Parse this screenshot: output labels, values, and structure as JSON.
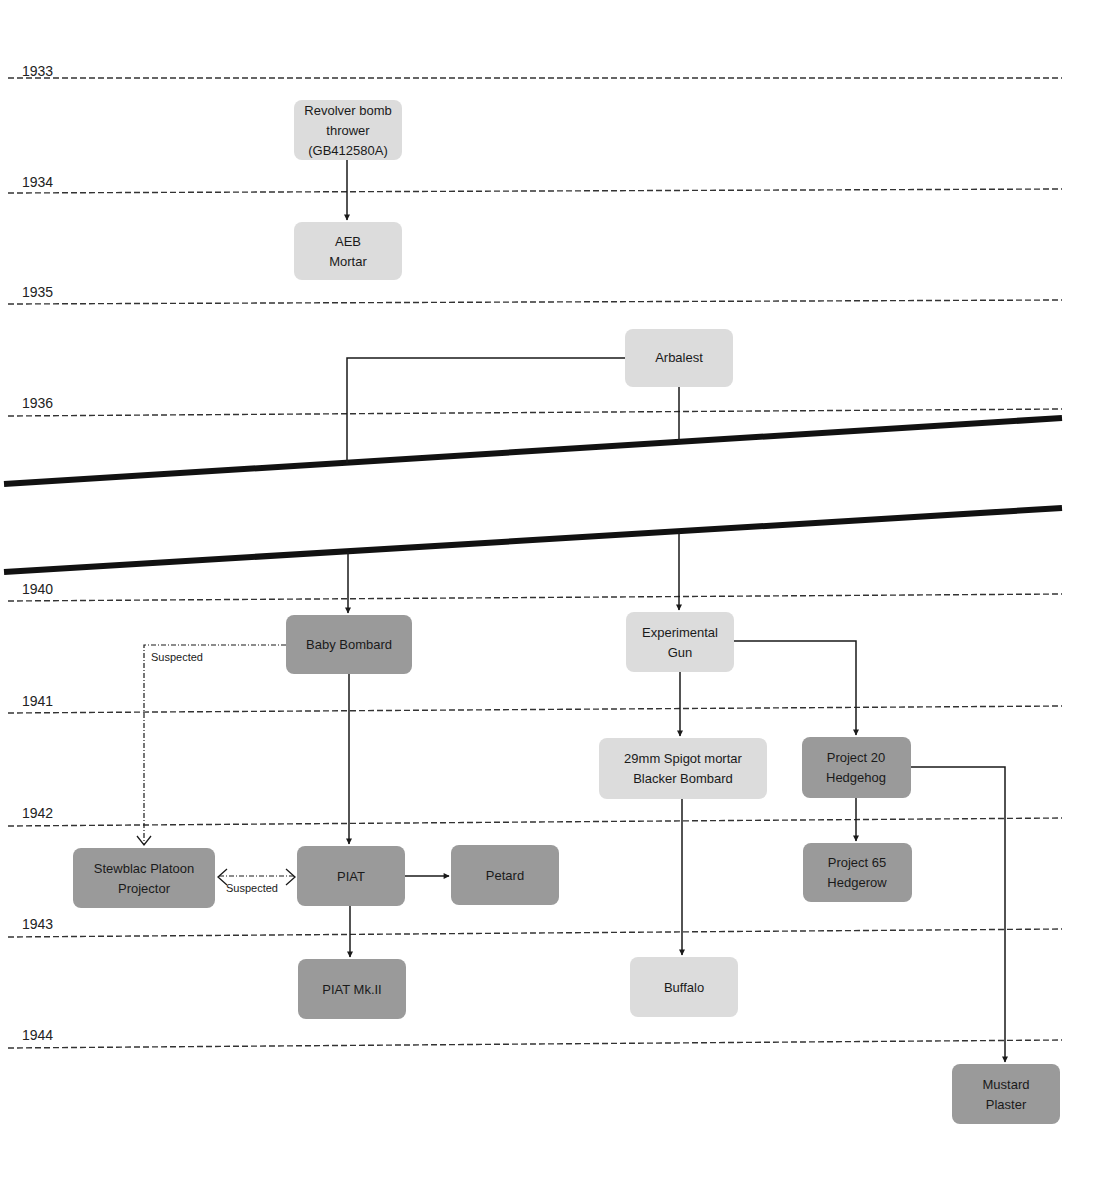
{
  "diagram": {
    "type": "timeline-genealogy",
    "colors": {
      "light_node": "#dcdcdc",
      "dark_node": "#9a9a9a",
      "line": "#1a1a1a",
      "background": "#ffffff"
    },
    "years": [
      {
        "label": "1933",
        "y": 78
      },
      {
        "label": "1934",
        "y": 190
      },
      {
        "label": "1935",
        "y": 300
      },
      {
        "label": "1936",
        "y": 412
      },
      {
        "label": "1940",
        "y": 598
      },
      {
        "label": "1941",
        "y": 710
      },
      {
        "label": "1942",
        "y": 822
      },
      {
        "label": "1943",
        "y": 932
      },
      {
        "label": "1944",
        "y": 1043
      }
    ],
    "nodes": [
      {
        "id": "revolver",
        "lines": [
          "Revolver bomb",
          "thrower",
          "(GB412580A)"
        ],
        "shade": "light",
        "x": 294,
        "y": 100,
        "w": 108,
        "h": 60
      },
      {
        "id": "aeb",
        "lines": [
          "AEB",
          "Mortar"
        ],
        "shade": "light",
        "x": 294,
        "y": 222,
        "w": 108,
        "h": 58
      },
      {
        "id": "arbalest",
        "lines": [
          "Arbalest"
        ],
        "shade": "light",
        "x": 625,
        "y": 329,
        "w": 108,
        "h": 58
      },
      {
        "id": "baby-bombard",
        "lines": [
          "Baby Bombard"
        ],
        "shade": "dark",
        "x": 286,
        "y": 615,
        "w": 126,
        "h": 59
      },
      {
        "id": "experimental-gun",
        "lines": [
          "Experimental",
          "Gun"
        ],
        "shade": "light",
        "x": 626,
        "y": 612,
        "w": 108,
        "h": 60
      },
      {
        "id": "spigot-mortar",
        "lines": [
          "29mm Spigot mortar",
          "Blacker Bombard"
        ],
        "shade": "light",
        "x": 599,
        "y": 738,
        "w": 168,
        "h": 61
      },
      {
        "id": "project-20",
        "lines": [
          "Project 20",
          "Hedgehog"
        ],
        "shade": "dark",
        "x": 802,
        "y": 737,
        "w": 109,
        "h": 61
      },
      {
        "id": "stewblac",
        "lines": [
          "Stewblac Platoon",
          "Projector"
        ],
        "shade": "dark",
        "x": 73,
        "y": 848,
        "w": 142,
        "h": 60
      },
      {
        "id": "piat",
        "lines": [
          "PIAT"
        ],
        "shade": "dark",
        "x": 297,
        "y": 846,
        "w": 108,
        "h": 60
      },
      {
        "id": "petard",
        "lines": [
          "Petard"
        ],
        "shade": "dark",
        "x": 451,
        "y": 845,
        "w": 108,
        "h": 60
      },
      {
        "id": "project-65",
        "lines": [
          "Project 65",
          "Hedgerow"
        ],
        "shade": "dark",
        "x": 803,
        "y": 843,
        "w": 109,
        "h": 59
      },
      {
        "id": "buffalo",
        "lines": [
          "Buffalo"
        ],
        "shade": "light",
        "x": 630,
        "y": 957,
        "w": 108,
        "h": 60
      },
      {
        "id": "piat-mk2",
        "lines": [
          "PIAT Mk.II"
        ],
        "shade": "dark",
        "x": 298,
        "y": 959,
        "w": 108,
        "h": 60
      },
      {
        "id": "mustard-plaster",
        "lines": [
          "Mustard",
          "Plaster"
        ],
        "shade": "dark",
        "x": 952,
        "y": 1064,
        "w": 108,
        "h": 60
      }
    ],
    "edges": [
      {
        "from": "Revolver bomb thrower (GB412580A)",
        "to": "AEB Mortar",
        "style": "solid"
      },
      {
        "from": "Arbalest",
        "to": "Baby Bombard",
        "style": "solid"
      },
      {
        "from": "Arbalest",
        "to": "Experimental Gun",
        "style": "solid"
      },
      {
        "from": "Baby Bombard",
        "to": "PIAT",
        "style": "solid"
      },
      {
        "from": "Baby Bombard",
        "to": "Stewblac Platoon Projector",
        "style": "dash-dot",
        "label": "Suspected"
      },
      {
        "from": "PIAT",
        "to": "Stewblac Platoon Projector",
        "style": "dash-dot-bidirectional",
        "label": "Suspected"
      },
      {
        "from": "PIAT",
        "to": "Petard",
        "style": "solid"
      },
      {
        "from": "PIAT",
        "to": "PIAT Mk.II",
        "style": "solid"
      },
      {
        "from": "Experimental Gun",
        "to": "29mm Spigot mortar Blacker Bombard",
        "style": "solid"
      },
      {
        "from": "Experimental Gun",
        "to": "Project 20 Hedgehog",
        "style": "solid"
      },
      {
        "from": "29mm Spigot mortar Blacker Bombard",
        "to": "Buffalo",
        "style": "solid"
      },
      {
        "from": "Project 20 Hedgehog",
        "to": "Project 65 Hedgerow",
        "style": "solid"
      },
      {
        "from": "Project 20 Hedgehog",
        "to": "Mustard Plaster",
        "style": "solid"
      }
    ],
    "edge_labels": {
      "suspected_top": "Suspected",
      "suspected_mid": "Suspected"
    },
    "time_break": {
      "between": [
        "1936",
        "1940"
      ],
      "style": "double-slanted-line"
    }
  }
}
